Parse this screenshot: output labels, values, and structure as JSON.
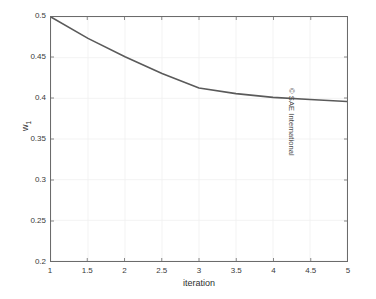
{
  "chart_data": {
    "type": "line",
    "title": "",
    "xlabel": "iteration",
    "ylabel": "w",
    "ylabel_subscript": "1",
    "xlim": [
      1,
      5
    ],
    "ylim": [
      0.2,
      0.5
    ],
    "grid": true,
    "legend": null,
    "x": [
      1,
      1.5,
      2,
      2.5,
      3,
      3.5,
      4,
      4.5,
      5
    ],
    "series": [
      {
        "name": "w1",
        "color": "#5a5a5a",
        "values": [
          0.5,
          0.4737,
          0.4512,
          0.4305,
          0.4128,
          0.4058,
          0.4012,
          0.3985,
          0.3962
        ]
      }
    ],
    "xticks": [
      1,
      1.5,
      2,
      2.5,
      3,
      3.5,
      4,
      4.5,
      5
    ],
    "xtick_labels": [
      "1",
      "1.5",
      "2",
      "2.5",
      "3",
      "3.5",
      "4",
      "4.5",
      "5"
    ],
    "yticks": [
      0.2,
      0.25,
      0.3,
      0.35,
      0.4,
      0.45,
      0.5
    ],
    "ytick_labels": [
      "0.2",
      "0.25",
      "0.3",
      "0.35",
      "0.4",
      "0.45",
      "0.5"
    ]
  },
  "annotations": {
    "copyright": "© SAE International"
  },
  "colors": {
    "line": "#5a5a5a",
    "axis": "#6b6b6b",
    "grid": "#f0f0f0",
    "text": "#2e2e2e",
    "background": "#ffffff"
  }
}
